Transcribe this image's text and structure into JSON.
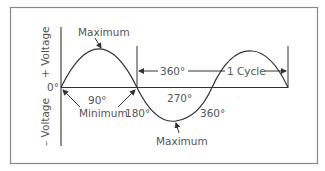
{
  "diagram": {
    "y_axis": {
      "positive_label": "+ Voltage",
      "negative_label": "– Voltage",
      "origin_label": "0°"
    },
    "labels": {
      "top_maximum": "Maximum",
      "bottom_maximum": "Maximum",
      "minimum": "Minimum",
      "deg_90": "90°",
      "deg_180": "180°",
      "deg_270": "270°",
      "deg_360_wave": "360°",
      "deg_360_span": "360°",
      "cycle": "1 Cycle"
    },
    "colors": {
      "line": "#333333",
      "border": "#888888",
      "text": "#555555"
    }
  }
}
